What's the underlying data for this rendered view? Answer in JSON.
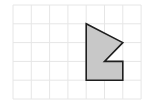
{
  "diagram": {
    "type": "grid-polygon",
    "grid": {
      "columns": 7,
      "rows": 5,
      "origin_x": 13,
      "origin_y": 5,
      "cell_w": 18.3,
      "cell_h": 18.8,
      "line_color": "#e6e6e6"
    },
    "polygon": {
      "vertices_grid": [
        [
          4,
          1
        ],
        [
          6,
          2
        ],
        [
          5,
          3
        ],
        [
          6,
          3
        ],
        [
          6,
          4
        ],
        [
          4,
          4
        ]
      ],
      "fill": "#c8c8c8",
      "stroke": "#1e1e1e",
      "stroke_width": 1.6
    }
  }
}
